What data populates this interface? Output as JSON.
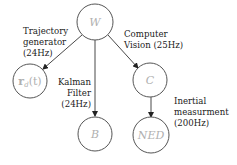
{
  "diagram": {
    "nodes": [
      {
        "id": "W",
        "label": "W",
        "cx": 95,
        "cy": 22,
        "r": 18
      },
      {
        "id": "rd",
        "label": "r_d(t)",
        "label_main": "r",
        "label_sub": "d",
        "label_rest": "(t)",
        "cx": 30,
        "cy": 81,
        "r": 17
      },
      {
        "id": "C",
        "label": "C",
        "cx": 150,
        "cy": 80,
        "r": 17
      },
      {
        "id": "B",
        "label": "B",
        "cx": 95,
        "cy": 134,
        "r": 17
      },
      {
        "id": "NED",
        "label": "NED",
        "cx": 151,
        "cy": 135,
        "r": 18
      }
    ],
    "edges": [
      {
        "from": "W",
        "to": "rd",
        "label_lines": [
          "Trajectory",
          "generator",
          "(24Hz)"
        ]
      },
      {
        "from": "W",
        "to": "B",
        "label_lines": [
          "Kalman",
          "Filter",
          "(24Hz)"
        ]
      },
      {
        "from": "W",
        "to": "C",
        "label_lines": [
          "Computer",
          "Vision (25Hz)"
        ]
      },
      {
        "from": "C",
        "to": "NED",
        "label_lines": [
          "Inertial",
          "measurment",
          "(200Hz)"
        ]
      }
    ]
  }
}
